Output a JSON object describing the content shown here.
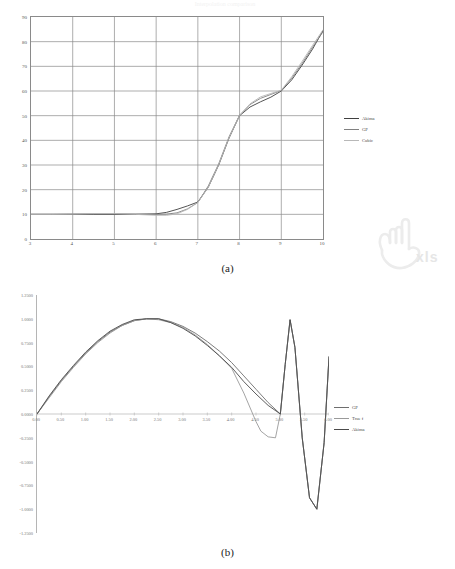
{
  "page": {
    "faint_top_title": "Interpolation comparison",
    "watermark_text": "xls",
    "watermark_icon": "hand-pointer-icon"
  },
  "figures": [
    {
      "id": "a",
      "caption": "(a)",
      "legend_position": "right",
      "chart_data": {
        "type": "line",
        "title": "",
        "xlabel": "",
        "ylabel": "",
        "xlim": [
          3,
          10
        ],
        "ylim": [
          0,
          90
        ],
        "grid": true,
        "xticks": [
          "3",
          "4",
          "5",
          "6",
          "7",
          "8",
          "9",
          "10"
        ],
        "yticks": [
          "0",
          "10",
          "20",
          "30",
          "40",
          "50",
          "60",
          "70",
          "80",
          "90"
        ],
        "legend": [
          "Akima",
          "GP",
          "Cubic"
        ],
        "colors": [
          "#404040",
          "#808080",
          "#b8b8b8"
        ],
        "series": [
          {
            "name": "Akima",
            "color": "#404040",
            "x": [
              3.0,
              3.5,
              4.0,
              4.5,
              5.0,
              5.5,
              6.0,
              6.25,
              6.5,
              6.75,
              7.0,
              7.25,
              7.5,
              7.75,
              8.0,
              8.25,
              8.5,
              8.75,
              9.0,
              9.25,
              9.5,
              9.75,
              10.0
            ],
            "values": [
              10.0,
              10.0,
              10.0,
              10.0,
              10.0,
              10.0,
              10.2,
              10.8,
              12.0,
              13.4,
              15.0,
              21.0,
              30.0,
              41.0,
              50.0,
              53.5,
              55.6,
              57.5,
              60.0,
              64.5,
              70.5,
              77.0,
              84.5
            ]
          },
          {
            "name": "GP",
            "color": "#808080",
            "x": [
              3.0,
              3.5,
              4.0,
              4.5,
              5.0,
              5.5,
              6.0,
              6.25,
              6.5,
              6.75,
              7.0,
              7.25,
              7.5,
              7.75,
              8.0,
              8.25,
              8.5,
              8.75,
              9.0,
              9.25,
              9.5,
              9.75,
              10.0
            ],
            "values": [
              10.0,
              10.0,
              10.1,
              10.2,
              10.2,
              10.1,
              10.0,
              10.1,
              10.6,
              12.2,
              14.8,
              21.5,
              30.5,
              41.5,
              50.2,
              54.5,
              57.0,
              58.6,
              60.2,
              65.2,
              71.2,
              77.8,
              84.0
            ]
          },
          {
            "name": "Cubic",
            "color": "#b8b8b8",
            "x": [
              3.0,
              3.5,
              4.0,
              4.5,
              5.0,
              5.5,
              6.0,
              6.25,
              6.5,
              6.75,
              7.0,
              7.25,
              7.5,
              7.75,
              8.0,
              8.25,
              8.5,
              8.75,
              9.0,
              9.25,
              9.5,
              9.75,
              10.0
            ],
            "values": [
              10.0,
              10.0,
              10.1,
              10.3,
              10.3,
              10.0,
              9.6,
              9.6,
              10.2,
              12.0,
              14.8,
              21.0,
              30.2,
              41.2,
              50.0,
              54.8,
              57.6,
              59.0,
              60.3,
              65.8,
              72.0,
              78.5,
              84.8
            ]
          }
        ]
      }
    },
    {
      "id": "b",
      "caption": "(b)",
      "legend_position": "right",
      "chart_data": {
        "type": "line",
        "title": "",
        "xlabel": "",
        "ylabel": "",
        "xlim": [
          0,
          6
        ],
        "ylim": [
          -1.25,
          1.25
        ],
        "grid": false,
        "xticks": [
          "0.00",
          "0.50",
          "1.00",
          "1.50",
          "2.00",
          "2.50",
          "3.00",
          "3.50",
          "4.00",
          "4.50",
          "5.00",
          "5.50",
          "6.00"
        ],
        "yticks": [
          "1.2500",
          "1.0000",
          "0.7500",
          "0.5000",
          "0.2500",
          "0.0000",
          "-0.2500",
          "-0.5000",
          "-0.7500",
          "-1.0000",
          "-1.2500"
        ],
        "legend": [
          "GP",
          "True f",
          "Akima"
        ],
        "colors": [
          "#6e6e6e",
          "#9a9a9a",
          "#4a4a4a"
        ],
        "series": [
          {
            "name": "GP",
            "color": "#6e6e6e",
            "x": [
              0.0,
              0.25,
              0.5,
              0.75,
              1.0,
              1.25,
              1.5,
              1.75,
              2.0,
              2.25,
              2.5,
              2.75,
              3.0,
              3.25,
              3.5,
              3.75,
              4.0,
              4.25,
              4.5,
              4.75,
              5.0,
              5.1,
              5.2,
              5.3,
              5.45,
              5.6,
              5.75,
              5.9,
              6.0
            ],
            "values": [
              0.0,
              0.18,
              0.35,
              0.5,
              0.64,
              0.76,
              0.86,
              0.93,
              0.98,
              1.0,
              1.0,
              0.97,
              0.92,
              0.85,
              0.76,
              0.66,
              0.54,
              0.4,
              0.26,
              0.12,
              0.0,
              0.52,
              0.99,
              0.7,
              -0.25,
              -0.88,
              -1.0,
              -0.3,
              0.6
            ]
          },
          {
            "name": "True f",
            "color": "#9a9a9a",
            "x": [
              0.0,
              0.25,
              0.5,
              0.75,
              1.0,
              1.25,
              1.5,
              1.75,
              2.0,
              2.25,
              2.5,
              2.75,
              3.0,
              3.25,
              3.5,
              3.75,
              4.0,
              4.25,
              4.5,
              4.6,
              4.75,
              4.9,
              5.0,
              5.1,
              5.2,
              5.3,
              5.45,
              5.6,
              5.75,
              5.9,
              6.0
            ],
            "values": [
              0.0,
              0.17,
              0.34,
              0.49,
              0.63,
              0.75,
              0.85,
              0.93,
              0.98,
              1.0,
              0.99,
              0.96,
              0.91,
              0.83,
              0.73,
              0.61,
              0.48,
              0.22,
              -0.08,
              -0.18,
              -0.24,
              -0.25,
              0.0,
              0.52,
              0.99,
              0.7,
              -0.25,
              -0.88,
              -1.0,
              -0.3,
              0.6
            ]
          },
          {
            "name": "Akima",
            "color": "#4a4a4a",
            "x": [
              0.0,
              0.25,
              0.5,
              0.75,
              1.0,
              1.25,
              1.5,
              1.75,
              2.0,
              2.25,
              2.5,
              2.75,
              3.0,
              3.25,
              3.5,
              3.75,
              4.0,
              4.25,
              4.5,
              4.75,
              5.0,
              5.1,
              5.2,
              5.3,
              5.45,
              5.6,
              5.75,
              5.9,
              6.0
            ],
            "values": [
              0.0,
              0.19,
              0.36,
              0.51,
              0.65,
              0.77,
              0.87,
              0.94,
              0.99,
              1.0,
              1.0,
              0.96,
              0.9,
              0.82,
              0.72,
              0.61,
              0.49,
              0.34,
              0.21,
              0.09,
              0.0,
              0.52,
              0.99,
              0.7,
              -0.25,
              -0.88,
              -1.0,
              -0.3,
              0.6
            ]
          }
        ]
      }
    }
  ]
}
